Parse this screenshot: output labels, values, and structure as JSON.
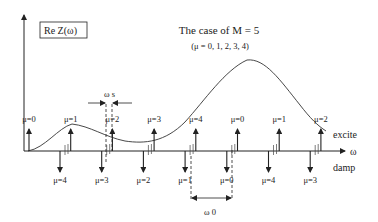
{
  "diagram": {
    "title": "The case of M = 5",
    "subtitle": "(μ = 0, 1, 2, 3, 4)",
    "y_axis_label": "Re Z(ω)",
    "x_axis_label": "ω",
    "excite_label": "excite",
    "damp_label": "damp",
    "omega_s_label": "ω s",
    "omega_0_label": "ω 0",
    "excite_lines": [
      {
        "label": "μ=0"
      },
      {
        "label": "μ=1"
      },
      {
        "label": "μ=2"
      },
      {
        "label": "μ=3"
      },
      {
        "label": "μ=4"
      },
      {
        "label": "μ=0"
      },
      {
        "label": "μ=1"
      },
      {
        "label": "μ=2"
      }
    ],
    "damp_lines": [
      {
        "label": "μ=4"
      },
      {
        "label": "μ=3"
      },
      {
        "label": "μ=2"
      },
      {
        "label": "μ=1"
      },
      {
        "label": "μ=0"
      },
      {
        "label": "μ=4"
      },
      {
        "label": "μ=3"
      }
    ],
    "colors": {
      "ink": "#222222",
      "background": "#ffffff"
    }
  }
}
